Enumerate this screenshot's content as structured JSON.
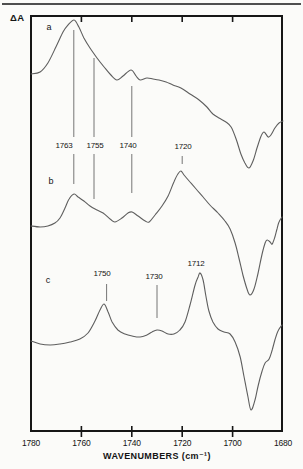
{
  "figure": {
    "y_axis_label": "ΔA",
    "x_axis_title": "WAVENUMBERS (cm⁻¹)",
    "panel_letters": [
      {
        "text": "a",
        "x": 49,
        "y": 27
      },
      {
        "text": "b",
        "x": 51,
        "y": 181
      },
      {
        "text": "c",
        "x": 48,
        "y": 280
      }
    ],
    "peak_labels": [
      {
        "text": "1763",
        "x": 64,
        "y": 145
      },
      {
        "text": "1755",
        "x": 95,
        "y": 145
      },
      {
        "text": "1740",
        "x": 128,
        "y": 145
      },
      {
        "text": "1720",
        "x": 183,
        "y": 146
      },
      {
        "text": "1750",
        "x": 102,
        "y": 273
      },
      {
        "text": "1730",
        "x": 154,
        "y": 276
      },
      {
        "text": "1712",
        "x": 196,
        "y": 263
      }
    ],
    "colors": {
      "curve": "#5e5e5e",
      "guide": "#757575",
      "frame": "#161616",
      "text": "#141414",
      "background": "#fbfbf9"
    }
  },
  "chart_data": {
    "type": "line",
    "title": "",
    "xlabel": "WAVENUMBERS (cm⁻¹)",
    "ylabel": "ΔA",
    "x_axis": {
      "min": 1680,
      "max": 1780,
      "reversed": true,
      "tick_labels": [
        "1780",
        "1760",
        "1740",
        "1720",
        "1700",
        "1680"
      ],
      "tick_label_values": [
        1780,
        1760,
        1740,
        1720,
        1700,
        1680
      ],
      "tick_marks": [
        1760,
        1740,
        1720,
        1700
      ]
    },
    "y_axis": {
      "label": "ΔA",
      "note": "arbitrary units, no numeric scale shown; series y values are pixel rows from image top (smaller = higher ΔA)"
    },
    "labeled_peaks": {
      "spectra_a_b": [
        1763,
        1755,
        1740,
        1720
      ],
      "spectrum_c": [
        1750,
        1730,
        1712
      ]
    },
    "guide_lines": [
      {
        "wn": 1763,
        "segments_y": [
          [
            30,
            137
          ],
          [
            154,
            184
          ]
        ]
      },
      {
        "wn": 1755,
        "segments_y": [
          [
            58,
            137
          ],
          [
            154,
            199
          ]
        ]
      },
      {
        "wn": 1740,
        "segments_y": [
          [
            86,
            137
          ],
          [
            154,
            193
          ]
        ]
      },
      {
        "wn": 1720,
        "segments_y": [
          [
            156,
            164
          ]
        ]
      },
      {
        "wn": 1750,
        "segments_y": [
          [
            284,
            301
          ]
        ]
      },
      {
        "wn": 1730,
        "segments_y": [
          [
            285,
            318
          ]
        ]
      }
    ],
    "series": [
      {
        "name": "a",
        "points": [
          [
            1780,
            74
          ],
          [
            1776.4,
            72
          ],
          [
            1773.3,
            63
          ],
          [
            1770.1,
            47
          ],
          [
            1767.3,
            32
          ],
          [
            1765.3,
            25
          ],
          [
            1762.9,
            20
          ],
          [
            1761,
            27
          ],
          [
            1759,
            38
          ],
          [
            1756.6,
            48
          ],
          [
            1753.8,
            58
          ],
          [
            1751,
            67
          ],
          [
            1748.3,
            75
          ],
          [
            1745.9,
            80
          ],
          [
            1743.5,
            76
          ],
          [
            1740.3,
            70
          ],
          [
            1738.3,
            76
          ],
          [
            1736.7,
            80
          ],
          [
            1734,
            78
          ],
          [
            1731.6,
            79
          ],
          [
            1729.2,
            80
          ],
          [
            1726.4,
            82
          ],
          [
            1723.7,
            85
          ],
          [
            1720.5,
            88
          ],
          [
            1716.9,
            94
          ],
          [
            1713.3,
            100
          ],
          [
            1710.2,
            107
          ],
          [
            1707.8,
            114
          ],
          [
            1705.4,
            118
          ],
          [
            1702.6,
            122
          ],
          [
            1700.6,
            127
          ],
          [
            1698.6,
            139
          ],
          [
            1696.7,
            154
          ],
          [
            1695.1,
            163
          ],
          [
            1693.5,
            168
          ],
          [
            1691.9,
            161
          ],
          [
            1690.3,
            148
          ],
          [
            1688.7,
            136
          ],
          [
            1687.5,
            132
          ],
          [
            1685.9,
            137
          ],
          [
            1684.8,
            135
          ],
          [
            1683.2,
            128
          ],
          [
            1681.6,
            123
          ],
          [
            1680,
            121
          ]
        ]
      },
      {
        "name": "b",
        "points": [
          [
            1780,
            226
          ],
          [
            1776.4,
            227
          ],
          [
            1773.3,
            226
          ],
          [
            1770.5,
            223
          ],
          [
            1768.5,
            218
          ],
          [
            1766.5,
            208
          ],
          [
            1764.9,
            199
          ],
          [
            1762.9,
            194
          ],
          [
            1761.3,
            197
          ],
          [
            1759,
            201
          ],
          [
            1756.6,
            206
          ],
          [
            1753.8,
            210
          ],
          [
            1751.4,
            213
          ],
          [
            1748.6,
            219
          ],
          [
            1746.7,
            222
          ],
          [
            1743.9,
            218
          ],
          [
            1741.5,
            213
          ],
          [
            1739.9,
            212
          ],
          [
            1737.5,
            216
          ],
          [
            1734.7,
            221
          ],
          [
            1733.1,
            222
          ],
          [
            1730.8,
            215
          ],
          [
            1728,
            206
          ],
          [
            1725.6,
            196
          ],
          [
            1723.3,
            182
          ],
          [
            1721.7,
            174
          ],
          [
            1720.5,
            171
          ],
          [
            1719.3,
            175
          ],
          [
            1716.9,
            182
          ],
          [
            1714.5,
            189
          ],
          [
            1711.7,
            197
          ],
          [
            1709,
            205
          ],
          [
            1705.8,
            213
          ],
          [
            1703,
            221
          ],
          [
            1701,
            229
          ],
          [
            1699,
            243
          ],
          [
            1697.5,
            258
          ],
          [
            1695.9,
            275
          ],
          [
            1694.3,
            289
          ],
          [
            1693.1,
            295
          ],
          [
            1691.5,
            289
          ],
          [
            1689.9,
            273
          ],
          [
            1688.3,
            254
          ],
          [
            1687.1,
            243
          ],
          [
            1686.3,
            240
          ],
          [
            1685.1,
            242
          ],
          [
            1684.3,
            244
          ],
          [
            1683.2,
            237
          ],
          [
            1682.4,
            229
          ],
          [
            1681.6,
            222
          ],
          [
            1680.4,
            217
          ]
        ]
      },
      {
        "name": "c",
        "points": [
          [
            1780,
            341
          ],
          [
            1776.4,
            344
          ],
          [
            1772.4,
            345
          ],
          [
            1768.5,
            344
          ],
          [
            1764.5,
            342
          ],
          [
            1760.6,
            339
          ],
          [
            1757.4,
            333
          ],
          [
            1754.6,
            321
          ],
          [
            1752.6,
            310
          ],
          [
            1751,
            304
          ],
          [
            1749.4,
            312
          ],
          [
            1747.8,
            322
          ],
          [
            1745.5,
            330
          ],
          [
            1742.7,
            334
          ],
          [
            1739.9,
            336
          ],
          [
            1736.7,
            337
          ],
          [
            1734,
            335
          ],
          [
            1732,
            332
          ],
          [
            1730,
            330
          ],
          [
            1728,
            331
          ],
          [
            1725.6,
            334
          ],
          [
            1723.3,
            334
          ],
          [
            1720.9,
            330
          ],
          [
            1718.9,
            322
          ],
          [
            1716.9,
            305
          ],
          [
            1714.9,
            285
          ],
          [
            1713.7,
            277
          ],
          [
            1712.9,
            273
          ],
          [
            1711.7,
            280
          ],
          [
            1710.6,
            296
          ],
          [
            1709.4,
            311
          ],
          [
            1707.8,
            322
          ],
          [
            1705.8,
            329
          ],
          [
            1703.4,
            332
          ],
          [
            1701,
            334
          ],
          [
            1699,
            342
          ],
          [
            1697,
            357
          ],
          [
            1695.5,
            376
          ],
          [
            1693.9,
            397
          ],
          [
            1692.7,
            410
          ],
          [
            1691.1,
            400
          ],
          [
            1689.9,
            386
          ],
          [
            1688.3,
            371
          ],
          [
            1687.1,
            363
          ],
          [
            1685.5,
            359
          ],
          [
            1684.3,
            350
          ],
          [
            1683.2,
            340
          ],
          [
            1682,
            331
          ],
          [
            1680.4,
            325
          ]
        ]
      }
    ],
    "layout": {
      "grid": false,
      "legend": false,
      "plot_px": {
        "left": 31,
        "right": 283,
        "top": 15,
        "bottom": 431
      },
      "top_tick_y": [
        16,
        22
      ],
      "bottom_tick_y": [
        426,
        437
      ],
      "x_tick_label_y": 443
    }
  }
}
